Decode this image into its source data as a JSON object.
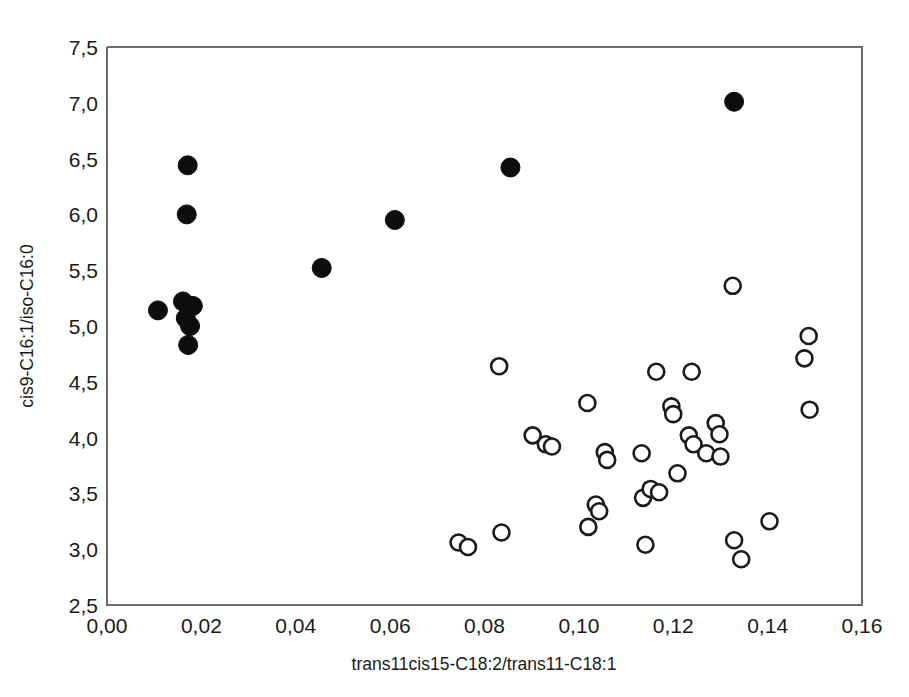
{
  "figure": {
    "background_color": "#ffffff",
    "frame_color": "#6b6b6b",
    "text_color": "#1a1a1a"
  },
  "axes": {
    "x_title": "trans11cis15-C18:2/trans11-C18:1",
    "y_title": "cis9-C16:1/iso-C16:0",
    "x_ticks": [
      "0,00",
      "0,02",
      "0,04",
      "0,06",
      "0,08",
      "0,10",
      "0,12",
      "0,14",
      "0,16"
    ],
    "y_ticks": [
      "2,5",
      "3,0",
      "3,5",
      "4,0",
      "4,5",
      "5,0",
      "5,5",
      "6,0",
      "6,5",
      "7,0",
      "7,5"
    ]
  },
  "chart_data": {
    "type": "scatter",
    "title": "",
    "xlabel": "trans11cis15-C18:2/trans11-C18:1",
    "ylabel": "cis9-C16:1/iso-C16:0",
    "xlim": [
      0.0,
      0.16
    ],
    "ylim": [
      2.5,
      7.5
    ],
    "xticks": [
      0.0,
      0.02,
      0.04,
      0.06,
      0.08,
      0.1,
      0.12,
      0.14,
      0.16
    ],
    "yticks": [
      2.5,
      3.0,
      3.5,
      4.0,
      4.5,
      5.0,
      5.5,
      6.0,
      6.5,
      7.0,
      7.5
    ],
    "grid": false,
    "legend": null,
    "series": [
      {
        "name": "filled-circles",
        "marker": "filled circle",
        "color": "#0d0d0d",
        "points": [
          [
            0.0108,
            5.14
          ],
          [
            0.0171,
            6.44
          ],
          [
            0.0169,
            6.0
          ],
          [
            0.0161,
            5.22
          ],
          [
            0.0182,
            5.18
          ],
          [
            0.0167,
            5.07
          ],
          [
            0.0176,
            5.0
          ],
          [
            0.0172,
            4.83
          ],
          [
            0.0455,
            5.52
          ],
          [
            0.061,
            5.95
          ],
          [
            0.0855,
            6.42
          ],
          [
            0.1329,
            7.01
          ]
        ]
      },
      {
        "name": "open-circles",
        "marker": "open circle",
        "color": "#1a1a1a",
        "points": [
          [
            0.0745,
            3.06
          ],
          [
            0.0765,
            3.02
          ],
          [
            0.0831,
            4.64
          ],
          [
            0.0836,
            3.15
          ],
          [
            0.0902,
            4.02
          ],
          [
            0.093,
            3.94
          ],
          [
            0.0943,
            3.92
          ],
          [
            0.1018,
            4.31
          ],
          [
            0.102,
            3.2
          ],
          [
            0.1036,
            3.4
          ],
          [
            0.1043,
            3.34
          ],
          [
            0.1055,
            3.87
          ],
          [
            0.106,
            3.8
          ],
          [
            0.1133,
            3.86
          ],
          [
            0.1136,
            3.46
          ],
          [
            0.1141,
            3.04
          ],
          [
            0.1152,
            3.54
          ],
          [
            0.1164,
            4.59
          ],
          [
            0.117,
            3.51
          ],
          [
            0.1196,
            4.28
          ],
          [
            0.12,
            4.21
          ],
          [
            0.1209,
            3.68
          ],
          [
            0.1233,
            4.02
          ],
          [
            0.1239,
            4.59
          ],
          [
            0.1243,
            3.94
          ],
          [
            0.127,
            3.86
          ],
          [
            0.129,
            4.13
          ],
          [
            0.1298,
            4.03
          ],
          [
            0.13,
            3.83
          ],
          [
            0.1326,
            5.36
          ],
          [
            0.1329,
            3.08
          ],
          [
            0.1344,
            2.91
          ],
          [
            0.1404,
            3.25
          ],
          [
            0.1478,
            4.71
          ],
          [
            0.1487,
            4.91
          ],
          [
            0.1489,
            4.25
          ]
        ]
      }
    ]
  }
}
